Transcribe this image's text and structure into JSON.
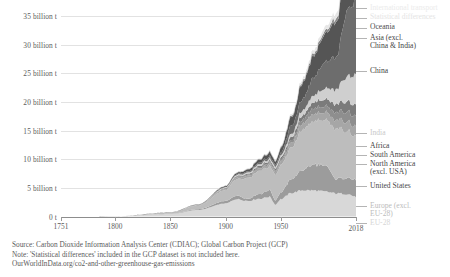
{
  "chart_data": {
    "type": "area",
    "title": "",
    "xlabel": "",
    "ylabel": "",
    "stacked": true,
    "grid": true,
    "legend_position": "right",
    "xlim": [
      1751,
      2018
    ],
    "ylim": [
      0,
      37
    ],
    "y_ticks": [
      "0 t",
      "5 billion t",
      "10 billion t",
      "15 billion t",
      "20 billion t",
      "25 billion t",
      "30 billion t",
      "35 billion t"
    ],
    "y_tick_values": [
      0,
      5,
      10,
      15,
      20,
      25,
      30,
      35
    ],
    "x_ticks": [
      "1751",
      "1800",
      "1850",
      "1900",
      "1950",
      "2018"
    ],
    "x_tick_values": [
      1751,
      1800,
      1850,
      1900,
      1950,
      2018
    ],
    "x": [
      1751,
      1800,
      1850,
      1875,
      1900,
      1910,
      1920,
      1930,
      1940,
      1945,
      1950,
      1960,
      1970,
      1980,
      1990,
      2000,
      2010,
      2018
    ],
    "series": [
      {
        "name": "EU-28",
        "color": "#d8d8d8",
        "values": [
          0.003,
          0.03,
          0.45,
          1.15,
          2.3,
          3.05,
          2.75,
          3.1,
          3.45,
          2.1,
          3.05,
          4.15,
          4.6,
          4.55,
          4.35,
          4.05,
          3.95,
          3.45
        ]
      },
      {
        "name": "Europe (excl. EU-28)",
        "color": "#9c9c9c",
        "values": [
          0.0,
          0.005,
          0.04,
          0.14,
          0.42,
          0.62,
          0.38,
          0.82,
          1.2,
          0.75,
          1.2,
          2.45,
          3.55,
          4.55,
          4.55,
          2.55,
          2.85,
          2.95
        ]
      },
      {
        "name": "United States",
        "color": "#bdbdbd",
        "values": [
          0.0,
          0.006,
          0.2,
          0.62,
          1.9,
          2.85,
          3.55,
          3.95,
          4.1,
          4.45,
          4.75,
          5.55,
          7.2,
          7.5,
          7.95,
          8.7,
          8.3,
          7.45
        ]
      },
      {
        "name": "North America (excl. USA)",
        "color": "#a6a6a6",
        "values": [
          0.0,
          0.002,
          0.01,
          0.05,
          0.17,
          0.28,
          0.35,
          0.42,
          0.48,
          0.52,
          0.58,
          0.78,
          1.05,
          1.25,
          1.3,
          1.5,
          1.65,
          1.7
        ]
      },
      {
        "name": "South America",
        "color": "#8e8e8e",
        "values": [
          0.0,
          0.001,
          0.01,
          0.03,
          0.08,
          0.13,
          0.17,
          0.22,
          0.26,
          0.28,
          0.33,
          0.48,
          0.72,
          1.0,
          1.05,
          1.35,
          1.7,
          1.8
        ]
      },
      {
        "name": "Africa",
        "color": "#7b7b7b",
        "values": [
          0.0,
          0.001,
          0.01,
          0.03,
          0.09,
          0.14,
          0.18,
          0.23,
          0.28,
          0.3,
          0.36,
          0.52,
          0.75,
          1.1,
          1.25,
          1.45,
          1.85,
          2.05
        ]
      },
      {
        "name": "India",
        "color": "#cfcfcf",
        "values": [
          0.0,
          0.001,
          0.01,
          0.04,
          0.12,
          0.18,
          0.22,
          0.27,
          0.33,
          0.33,
          0.38,
          0.55,
          0.85,
          1.2,
          1.9,
          2.55,
          4.35,
          5.25
        ]
      },
      {
        "name": "China",
        "color": "#6d6d6d",
        "values": [
          0.0,
          0.001,
          0.01,
          0.03,
          0.08,
          0.12,
          0.18,
          0.25,
          0.35,
          0.32,
          0.45,
          1.45,
          1.95,
          3.15,
          4.55,
          5.65,
          11.2,
          13.1
        ]
      },
      {
        "name": "Asia (excl. China & India)",
        "color": "#555555",
        "values": [
          0.0,
          0.001,
          0.01,
          0.04,
          0.14,
          0.24,
          0.35,
          0.52,
          0.72,
          0.55,
          0.85,
          1.55,
          2.85,
          3.85,
          4.95,
          6.15,
          7.95,
          8.95
        ]
      },
      {
        "name": "Oceania",
        "color": "#8a8a8a",
        "values": [
          0.0,
          0.0,
          0.005,
          0.02,
          0.05,
          0.07,
          0.09,
          0.11,
          0.14,
          0.15,
          0.17,
          0.24,
          0.34,
          0.44,
          0.52,
          0.62,
          0.72,
          0.75
        ]
      },
      {
        "name": "Statistical differences",
        "color": "#efefef",
        "values": [
          0.0,
          0.0,
          0.0,
          0.0,
          0.01,
          0.01,
          0.02,
          0.02,
          0.02,
          0.02,
          0.03,
          0.04,
          0.05,
          0.06,
          0.07,
          0.08,
          0.09,
          0.1
        ]
      },
      {
        "name": "International transport",
        "color": "#e6e6e6",
        "values": [
          0.0,
          0.0,
          0.0,
          0.01,
          0.03,
          0.05,
          0.07,
          0.09,
          0.12,
          0.13,
          0.16,
          0.24,
          0.38,
          0.52,
          0.62,
          0.82,
          1.05,
          1.2
        ]
      }
    ]
  },
  "legend": {
    "items": [
      {
        "label": "International transport",
        "faint": true
      },
      {
        "label": "Statistical differences",
        "faint": true
      },
      {
        "label": "Oceania",
        "faint": false
      },
      {
        "label": "Asia (excl.",
        "label2": "China & India)",
        "faint": false
      },
      {
        "label": "China",
        "faint": false
      },
      {
        "label": "India",
        "faint": true
      },
      {
        "label": "Africa",
        "faint": false
      },
      {
        "label": "South America",
        "faint": false
      },
      {
        "label": "North America",
        "label2": "(excl. USA)",
        "faint": false
      },
      {
        "label": "United States",
        "faint": false
      },
      {
        "label": "Europe (excl.",
        "label2": "EU-28)",
        "faint": true
      },
      {
        "label": "EU-28",
        "faint": true
      }
    ]
  },
  "footer": {
    "source": "Source: Carbon Dioxide Information Analysis Center (CDIAC); Global Carbon Project (GCP)",
    "note": "Note: 'Statistical differences' included in the GCP dataset is not included here.",
    "url": "OurWorldInData.org/co2-and-other-greenhouse-gas-emissions"
  }
}
